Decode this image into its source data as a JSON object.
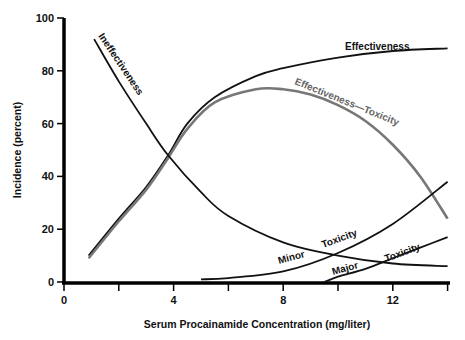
{
  "chart_data": {
    "type": "line",
    "title": "",
    "xlabel": "Serum Procainamide Concentration (mg/liter)",
    "ylabel": "Incidence (percent)",
    "xlim": [
      0,
      14
    ],
    "ylim": [
      0,
      100
    ],
    "x_ticks": [
      0,
      2,
      4,
      6,
      8,
      10,
      12,
      14
    ],
    "x_tick_labels": [
      "0",
      "",
      "4",
      "",
      "8",
      "",
      "12",
      ""
    ],
    "y_ticks": [
      0,
      20,
      40,
      60,
      80,
      100
    ],
    "y_tick_labels": [
      "0",
      "20",
      "40",
      "60",
      "80",
      "100"
    ],
    "grid": false,
    "legend": "inline labels",
    "series": [
      {
        "name": "Effectiveness",
        "color": "#111111",
        "label": "Effectiveness",
        "x": [
          0.9,
          2,
          3,
          3.8,
          4.5,
          5.5,
          7,
          8,
          10,
          12,
          14
        ],
        "y": [
          10,
          24,
          36,
          48,
          60,
          70,
          78,
          81,
          85,
          87.5,
          88.5
        ]
      },
      {
        "name": "Effectiveness—Toxicity",
        "color": "#777777",
        "label": "Effectiveness—Toxicity",
        "x": [
          0.9,
          2,
          3,
          3.8,
          4.5,
          5.5,
          7,
          8,
          9,
          10,
          11,
          12,
          13,
          14
        ],
        "y": [
          9,
          23,
          35,
          47,
          58,
          68,
          73,
          73,
          71,
          67,
          61,
          52,
          40,
          24
        ]
      },
      {
        "name": "Ineffectiveness",
        "color": "#111111",
        "label": "Ineffectiveness",
        "x": [
          1.1,
          2,
          3,
          3.8,
          5,
          6,
          8,
          10,
          12,
          14
        ],
        "y": [
          92,
          76,
          60,
          48,
          34,
          25,
          15,
          10,
          7,
          6
        ]
      },
      {
        "name": "Minor Toxicity",
        "color": "#111111",
        "label": "Minor Toxicity",
        "x": [
          5,
          6,
          8,
          10,
          12,
          14
        ],
        "y": [
          1,
          1.5,
          4,
          11,
          22,
          38
        ]
      },
      {
        "name": "Major Toxicity",
        "color": "#111111",
        "label": "Major Toxicity",
        "x": [
          9.5,
          10,
          11,
          12,
          13,
          14
        ],
        "y": [
          0,
          2,
          5,
          9,
          13,
          17
        ]
      }
    ]
  },
  "labels": {
    "effectiveness": "Effectiveness",
    "eff_tox": "Effectiveness—Toxicity",
    "ineffectiveness": "Ineffectiveness",
    "minor": "Minor",
    "major": "Major",
    "toxicity": "Toxicity"
  }
}
